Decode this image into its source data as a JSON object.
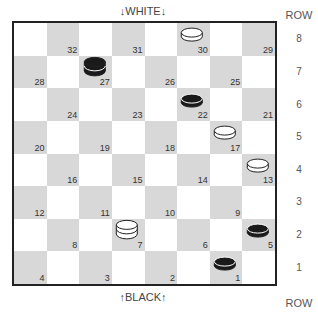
{
  "labels": {
    "top": "↓WHITE↓",
    "bottom": "↑BLACK↑",
    "row_header_top": "ROW",
    "row_header_bottom": "ROW"
  },
  "rows": [
    "8",
    "7",
    "6",
    "5",
    "4",
    "3",
    "2",
    "1"
  ],
  "board": {
    "squares": [
      {
        "num": "32",
        "row": 0,
        "col": 1
      },
      {
        "num": "31",
        "row": 0,
        "col": 3
      },
      {
        "num": "30",
        "row": 0,
        "col": 5
      },
      {
        "num": "29",
        "row": 0,
        "col": 7
      },
      {
        "num": "28",
        "row": 1,
        "col": 0
      },
      {
        "num": "27",
        "row": 1,
        "col": 2
      },
      {
        "num": "26",
        "row": 1,
        "col": 4
      },
      {
        "num": "25",
        "row": 1,
        "col": 6
      },
      {
        "num": "24",
        "row": 2,
        "col": 1
      },
      {
        "num": "23",
        "row": 2,
        "col": 3
      },
      {
        "num": "22",
        "row": 2,
        "col": 5
      },
      {
        "num": "21",
        "row": 2,
        "col": 7
      },
      {
        "num": "20",
        "row": 3,
        "col": 0
      },
      {
        "num": "19",
        "row": 3,
        "col": 2
      },
      {
        "num": "18",
        "row": 3,
        "col": 4
      },
      {
        "num": "17",
        "row": 3,
        "col": 6
      },
      {
        "num": "16",
        "row": 4,
        "col": 1
      },
      {
        "num": "15",
        "row": 4,
        "col": 3
      },
      {
        "num": "14",
        "row": 4,
        "col": 5
      },
      {
        "num": "13",
        "row": 4,
        "col": 7
      },
      {
        "num": "12",
        "row": 5,
        "col": 0
      },
      {
        "num": "11",
        "row": 5,
        "col": 2
      },
      {
        "num": "10",
        "row": 5,
        "col": 4
      },
      {
        "num": "9",
        "row": 5,
        "col": 6
      },
      {
        "num": "8",
        "row": 6,
        "col": 1
      },
      {
        "num": "7",
        "row": 6,
        "col": 3
      },
      {
        "num": "6",
        "row": 6,
        "col": 5
      },
      {
        "num": "5",
        "row": 6,
        "col": 7
      },
      {
        "num": "4",
        "row": 7,
        "col": 0
      },
      {
        "num": "3",
        "row": 7,
        "col": 2
      },
      {
        "num": "2",
        "row": 7,
        "col": 4
      },
      {
        "num": "1",
        "row": 7,
        "col": 6
      }
    ],
    "pieces": [
      {
        "square": "30",
        "color": "white",
        "type": "man"
      },
      {
        "square": "27",
        "color": "black",
        "type": "king"
      },
      {
        "square": "22",
        "color": "black",
        "type": "man"
      },
      {
        "square": "17",
        "color": "white",
        "type": "man"
      },
      {
        "square": "13",
        "color": "white",
        "type": "man"
      },
      {
        "square": "7",
        "color": "white",
        "type": "king"
      },
      {
        "square": "5",
        "color": "black",
        "type": "man"
      },
      {
        "square": "1",
        "color": "black",
        "type": "man"
      }
    ]
  },
  "colors": {
    "dark_square": "#d8d8d8",
    "light_square": "#ffffff",
    "border": "#222222",
    "black_piece": "#1a1a1a",
    "white_piece": "#ffffff"
  }
}
